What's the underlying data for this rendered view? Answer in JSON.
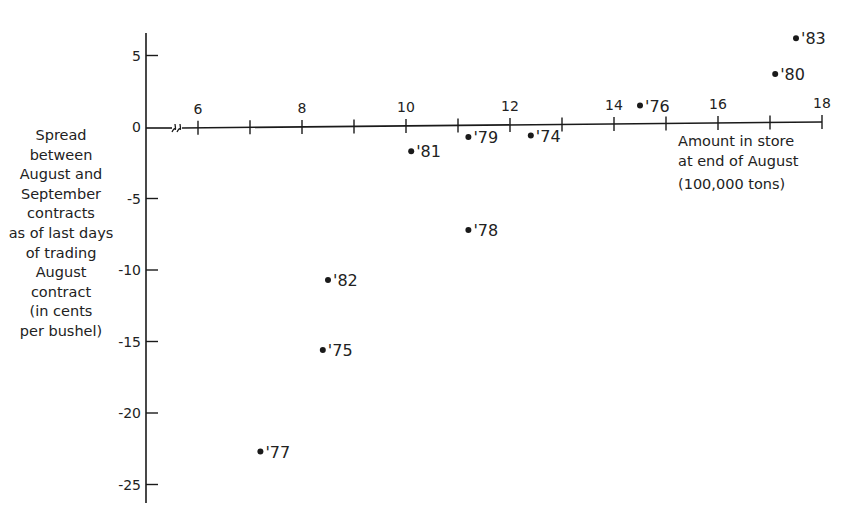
{
  "chart_data": {
    "type": "scatter",
    "title": "",
    "xlabel": "Amount in store at end of August (100,000 tons)",
    "ylabel": "Spread between August and September contracts as of last days of trading August contract (in cents per bushel)",
    "xlim": [
      5,
      18
    ],
    "ylim": [
      -26,
      7
    ],
    "x_axis_break": true,
    "grid": false,
    "legend": null,
    "x_ticks": [
      6,
      7,
      8,
      9,
      10,
      11,
      12,
      13,
      14,
      15,
      16,
      17,
      18
    ],
    "x_tick_labels": [
      "6",
      "8",
      "10",
      "12",
      "14",
      "16",
      "18"
    ],
    "y_ticks": [
      5,
      0,
      -5,
      -10,
      -15,
      -20,
      -25
    ],
    "y_tick_labels": [
      "5",
      "0",
      "-5",
      "-10",
      "-15",
      "-20",
      "-25"
    ],
    "points": [
      {
        "label": "'83",
        "x": 17.5,
        "y": 6.2
      },
      {
        "label": "'80",
        "x": 17.1,
        "y": 3.7
      },
      {
        "label": "'76",
        "x": 14.5,
        "y": 1.5
      },
      {
        "label": "'81",
        "x": 10.1,
        "y": -1.7
      },
      {
        "label": "'79",
        "x": 11.2,
        "y": -0.7
      },
      {
        "label": "'74",
        "x": 12.4,
        "y": -0.6
      },
      {
        "label": "'78",
        "x": 11.2,
        "y": -7.2
      },
      {
        "label": "'82",
        "x": 8.5,
        "y": -10.7
      },
      {
        "label": "'75",
        "x": 8.4,
        "y": -15.6
      },
      {
        "label": "'77",
        "x": 7.2,
        "y": -22.7
      }
    ]
  },
  "labels": {
    "ylabel_lines": [
      "Spread",
      "between",
      "August and",
      "September",
      "contracts",
      "as of last days",
      "of trading",
      "August",
      "contract",
      "(in cents",
      "per bushel)"
    ],
    "xlabel_lines": [
      "Amount in store",
      "at end of August"
    ],
    "xlabel_unit": "(100,000 tons)"
  },
  "colors": {
    "ink": "#1a1a1a",
    "background": "#ffffff"
  }
}
